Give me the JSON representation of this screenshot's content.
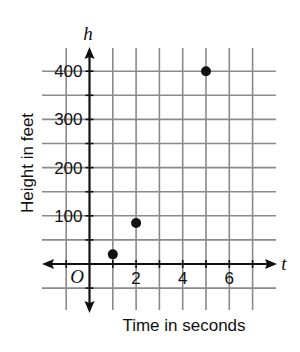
{
  "chart_data": {
    "type": "scatter",
    "title": "",
    "xlabel": "Time in seconds",
    "ylabel": "Height in feet",
    "x_var": "t",
    "y_var": "h",
    "origin_label": "O",
    "x_ticks": [
      2,
      4,
      6
    ],
    "x_tick_labels": [
      "2",
      "4",
      "6"
    ],
    "y_ticks": [
      100,
      200,
      300,
      400
    ],
    "y_tick_labels": [
      "100",
      "200",
      "300",
      "400"
    ],
    "xlim": [
      -2,
      8
    ],
    "ylim": [
      -100,
      450
    ],
    "x_grid_step": 1,
    "y_grid_step": 50,
    "grid": true,
    "legend": null,
    "series": [
      {
        "name": "points",
        "x": [
          1,
          2,
          5
        ],
        "y": [
          20,
          85,
          400
        ]
      }
    ],
    "colors": {
      "grid": "#8a8a8a",
      "axis": "#111111",
      "point": "#111111"
    }
  }
}
